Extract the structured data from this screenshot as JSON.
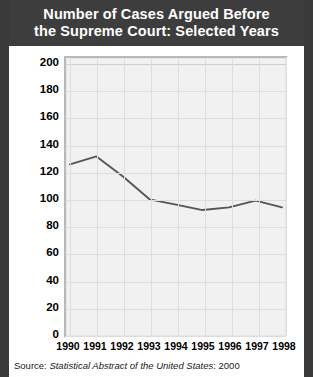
{
  "title": "Number of Cases Argued Before the Supreme Court: Selected Years",
  "title_line1": "Number of Cases Argued Before",
  "title_line2": "the Supreme Court: Selected Years",
  "source": {
    "prefix": "Source:",
    "publication": "Statistical Abstract of the United States",
    "suffix": ": 2000"
  },
  "colors": {
    "title_bar": "#3d3d3d",
    "title_text": "#ffffff",
    "panel": "#f1f1f1",
    "gridline": "#dddddd",
    "series": "#555555",
    "rail": "#3a3a3a"
  },
  "chart_data": {
    "type": "line",
    "title": "Number of Cases Argued Before the Supreme Court: Selected Years",
    "xlabel": "",
    "ylabel": "",
    "x": [
      1990,
      1991,
      1992,
      1993,
      1994,
      1995,
      1996,
      1997,
      1998
    ],
    "categories": [
      "1990",
      "1991",
      "1992",
      "1993",
      "1994",
      "1995",
      "1996",
      "1997",
      "1998"
    ],
    "values": [
      125,
      131,
      116,
      99,
      95,
      91,
      93,
      98,
      93
    ],
    "series": [
      {
        "name": "Cases argued",
        "values": [
          125,
          131,
          116,
          99,
          95,
          91,
          93,
          98,
          93
        ]
      }
    ],
    "ylim": [
      0,
      200
    ],
    "xlim": [
      1990,
      1998
    ],
    "yticks": [
      0,
      20,
      40,
      60,
      80,
      100,
      120,
      140,
      160,
      180,
      200
    ],
    "ytick_labels": [
      "0",
      "20",
      "40",
      "60",
      "80",
      "100",
      "120",
      "140",
      "160",
      "180",
      "200"
    ],
    "xtick_labels": [
      "1990",
      "1991",
      "1992",
      "1993",
      "1994",
      "1995",
      "1996",
      "1997",
      "1998"
    ],
    "grid": true,
    "legend": false,
    "legend_position": "none",
    "line_color": "#555555",
    "markers": false
  }
}
